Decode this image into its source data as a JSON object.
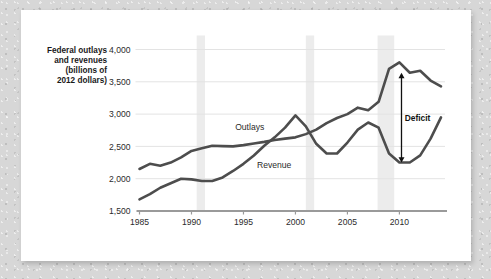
{
  "figure": {
    "background_color": "#d7d7d7",
    "card_color": "#ffffff"
  },
  "chart_data": {
    "type": "line",
    "title": "",
    "ylabel_lines": [
      "Federal outlays",
      "and revenues",
      "(billions of",
      "2012 dollars)"
    ],
    "xlabel": "",
    "xlim": [
      1985,
      2014
    ],
    "ylim": [
      1500,
      4000
    ],
    "yticks": [
      1500,
      2000,
      2500,
      3000,
      3500,
      4000
    ],
    "ytick_labels": [
      "1,500",
      "2,000",
      "2,500",
      "3,000",
      "3,500",
      "4,000"
    ],
    "xticks": [
      1985,
      1990,
      1995,
      2000,
      2005,
      2010
    ],
    "xtick_labels": [
      "1985",
      "1990",
      "1995",
      "2000",
      "2005",
      "2010"
    ],
    "grid": "horizontal",
    "legend": "inline-labels",
    "line_color": "#4d4d4d",
    "x": [
      1985,
      1986,
      1987,
      1988,
      1989,
      1990,
      1991,
      1992,
      1993,
      1994,
      1995,
      1996,
      1997,
      1998,
      1999,
      2000,
      2001,
      2002,
      2003,
      2004,
      2005,
      2006,
      2007,
      2008,
      2009,
      2010,
      2011,
      2012,
      2013,
      2014
    ],
    "series": [
      {
        "name": "Outlays",
        "label": "Outlays",
        "values": [
          2150,
          2230,
          2200,
          2250,
          2330,
          2430,
          2470,
          2510,
          2505,
          2500,
          2520,
          2545,
          2570,
          2600,
          2620,
          2640,
          2690,
          2760,
          2860,
          2940,
          3000,
          3100,
          3060,
          3190,
          3700,
          3800,
          3640,
          3670,
          3520,
          3430
        ]
      },
      {
        "name": "Revenue",
        "label": "Revenue",
        "values": [
          1680,
          1760,
          1860,
          1930,
          2000,
          1990,
          1965,
          1965,
          2020,
          2120,
          2230,
          2360,
          2510,
          2640,
          2790,
          2980,
          2810,
          2540,
          2390,
          2390,
          2560,
          2760,
          2870,
          2790,
          2390,
          2250,
          2250,
          2360,
          2620,
          2950
        ]
      }
    ],
    "recession_bands": [
      {
        "start": 1990.5,
        "end": 1991.3
      },
      {
        "start": 2001.0,
        "end": 2001.8
      },
      {
        "start": 2007.9,
        "end": 2009.5
      }
    ],
    "annotations": [
      {
        "name": "deficit",
        "text": "Deficit",
        "x": 2010.2,
        "y_top": 3640,
        "y_bottom": 2250,
        "arrow": "double-headed-vertical"
      }
    ]
  }
}
